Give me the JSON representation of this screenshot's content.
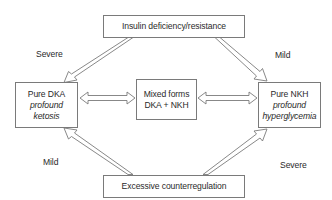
{
  "diagram": {
    "nodes": {
      "top": {
        "label": "Insulin deficiency/resistance"
      },
      "left": {
        "title": "Pure DKA",
        "line2": "profound",
        "line3": "ketosis"
      },
      "center": {
        "line1": "Mixed forms",
        "line2": "DKA + NKH"
      },
      "right": {
        "title": "Pure NKH",
        "line2": "profound",
        "line3": "hyperglycemia"
      },
      "bottom": {
        "label": "Excessive counterregulation"
      }
    },
    "edge_labels": {
      "top_left": "Severe",
      "top_right": "Mild",
      "bottom_left": "Mild",
      "bottom_right": "Severe"
    },
    "edges": [
      {
        "from": "top",
        "to": "left",
        "label": "Severe",
        "style": "hollow-arrow"
      },
      {
        "from": "top",
        "to": "right",
        "label": "Mild",
        "style": "hollow-arrow"
      },
      {
        "from": "bottom",
        "to": "left",
        "label": "Mild",
        "style": "hollow-arrow"
      },
      {
        "from": "bottom",
        "to": "right",
        "label": "Severe",
        "style": "hollow-arrow"
      },
      {
        "from": "left",
        "to": "center",
        "style": "hollow-double-arrow"
      },
      {
        "from": "center",
        "to": "right",
        "style": "hollow-double-arrow"
      }
    ],
    "colors": {
      "stroke": "#7a7a7a",
      "text": "#2a2a2a",
      "background": "#ffffff"
    }
  }
}
